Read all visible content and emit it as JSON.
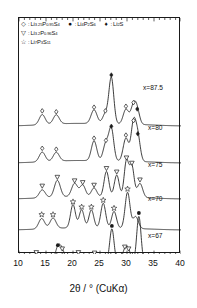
{
  "figure": {
    "kind": "xrd-pattern-stack",
    "axis_color": "#1a1a1a",
    "curve_color": "#1a1a1a",
    "background": "#ffffff"
  },
  "legend": {
    "rows": [
      [
        {
          "marker": "open-diamond",
          "glyph": "◇",
          "sep": ":",
          "label": "Li3.25P0.95S4",
          "label_html": "Li<sub>3.25</sub>P<sub>0.95</sub>S<sub>4</sub>"
        },
        {
          "marker": "filled-circle",
          "glyph": "●",
          "sep": ":",
          "label": "Li4P2S6",
          "label_html": "Li<sub>4</sub>P<sub>2</sub>S<sub>6</sub>"
        },
        {
          "marker": "filled-diamond",
          "glyph": "♦",
          "sep": ":",
          "label": "Li2S",
          "label_html": "Li<sub>2</sub>S"
        }
      ],
      [
        {
          "marker": "open-triangle-down",
          "glyph": "▽",
          "sep": ":",
          "label": "Li3.2P0.96S4",
          "label_html": "Li<sub>3.2</sub>P<sub>0.96</sub>S<sub>4</sub>"
        }
      ],
      [
        {
          "marker": "open-star",
          "glyph": "☆",
          "sep": ":",
          "label": "Li7P3S11",
          "label_html": "Li<sub>7</sub>P<sub>3</sub>S<sub>11</sub>"
        }
      ]
    ]
  },
  "xaxis": {
    "title": "2θ / ° (CuKα)",
    "min": 10,
    "max": 40,
    "major_ticks": [
      10,
      15,
      20,
      25,
      30,
      35,
      40
    ],
    "tick_labels": [
      "10",
      "15",
      "20",
      "25",
      "30",
      "35",
      "40"
    ],
    "minor_tick_step": 1
  },
  "yaxis": {
    "title": "",
    "tick_labels": [],
    "note": "Intensity / arb. units (offset stacked, unlabeled)"
  },
  "curve_labels": [
    {
      "text": "x=87.5",
      "composition_x": 87.5
    },
    {
      "text": "x=80",
      "composition_x": 80
    },
    {
      "text": "x=75",
      "composition_x": 75
    },
    {
      "text": "x=70",
      "composition_x": 70
    },
    {
      "text": "x=67",
      "composition_x": 67
    }
  ],
  "chart_data": {
    "type": "line",
    "title": "",
    "xlabel": "2θ / ° (CuKα)",
    "ylabel": "Intensity / arb. units",
    "xlim": [
      10,
      40
    ],
    "grid": false,
    "legend_position": "top-inside",
    "series": [
      {
        "name": "x=87.5",
        "label": "x=87.5",
        "peaks": [
          {
            "two_theta": 14.3,
            "height": 0.22,
            "width": 0.55,
            "marker": "open-diamond"
          },
          {
            "two_theta": 16.9,
            "height": 0.2,
            "width": 0.55,
            "marker": "open-diamond"
          },
          {
            "two_theta": 23.9,
            "height": 0.3,
            "width": 0.55,
            "marker": "open-diamond"
          },
          {
            "two_theta": 26.0,
            "height": 0.22,
            "width": 0.5,
            "marker": "open-diamond"
          },
          {
            "two_theta": 27.1,
            "height": 1.0,
            "width": 0.45,
            "marker": "filled-diamond"
          },
          {
            "two_theta": 29.8,
            "height": 0.32,
            "width": 0.5,
            "marker": "open-diamond"
          },
          {
            "two_theta": 31.2,
            "height": 0.4,
            "width": 0.5,
            "marker": "open-diamond"
          },
          {
            "two_theta": 31.9,
            "height": 0.26,
            "width": 0.45,
            "marker": "filled-diamond"
          }
        ]
      },
      {
        "name": "x=80",
        "label": "x=80",
        "peaks": [
          {
            "two_theta": 14.3,
            "height": 0.22,
            "width": 0.55,
            "marker": "open-diamond"
          },
          {
            "two_theta": 16.9,
            "height": 0.2,
            "width": 0.55,
            "marker": "open-diamond"
          },
          {
            "two_theta": 23.9,
            "height": 0.45,
            "width": 0.5,
            "marker": "open-diamond"
          },
          {
            "two_theta": 26.1,
            "height": 0.4,
            "width": 0.5,
            "marker": "open-diamond"
          },
          {
            "two_theta": 27.1,
            "height": 0.72,
            "width": 0.45,
            "marker": "filled-diamond"
          },
          {
            "two_theta": 29.8,
            "height": 0.52,
            "width": 0.5,
            "marker": "open-diamond"
          },
          {
            "two_theta": 31.2,
            "height": 0.85,
            "width": 0.45,
            "marker": "open-diamond"
          },
          {
            "two_theta": 32.0,
            "height": 0.55,
            "width": 0.45,
            "marker": "filled-diamond"
          }
        ]
      },
      {
        "name": "x=75",
        "label": "x=75",
        "peaks": [
          {
            "two_theta": 14.3,
            "height": 0.18,
            "width": 0.55,
            "marker": "open-triangle-down"
          },
          {
            "two_theta": 17.1,
            "height": 0.38,
            "width": 0.55,
            "marker": "open-triangle-down"
          },
          {
            "two_theta": 20.3,
            "height": 0.3,
            "width": 0.55,
            "marker": "open-triangle-down"
          },
          {
            "two_theta": 21.8,
            "height": 0.26,
            "width": 0.5,
            "marker": "open-triangle-down"
          },
          {
            "two_theta": 23.9,
            "height": 0.2,
            "width": 0.5,
            "marker": "open-triangle-down"
          },
          {
            "two_theta": 26.2,
            "height": 0.58,
            "width": 0.45,
            "marker": "open-triangle-down"
          },
          {
            "two_theta": 28.1,
            "height": 0.5,
            "width": 0.45,
            "marker": "open-triangle-down"
          },
          {
            "two_theta": 29.9,
            "height": 0.82,
            "width": 0.42,
            "marker": "open-triangle-down"
          },
          {
            "two_theta": 30.9,
            "height": 0.7,
            "width": 0.42,
            "marker": "open-triangle-down"
          },
          {
            "two_theta": 32.4,
            "height": 0.32,
            "width": 0.5,
            "marker": "open-triangle-down"
          }
        ]
      },
      {
        "name": "x=70",
        "label": "x=70",
        "peaks": [
          {
            "two_theta": 14.2,
            "height": 0.26,
            "width": 0.55,
            "marker": "open-star"
          },
          {
            "two_theta": 16.3,
            "height": 0.26,
            "width": 0.55,
            "marker": "open-star"
          },
          {
            "two_theta": 20.0,
            "height": 0.58,
            "width": 0.45,
            "marker": "open-star"
          },
          {
            "two_theta": 21.6,
            "height": 0.45,
            "width": 0.45,
            "marker": "open-star"
          },
          {
            "two_theta": 23.4,
            "height": 0.45,
            "width": 0.45,
            "marker": "open-star"
          },
          {
            "two_theta": 25.6,
            "height": 0.62,
            "width": 0.45,
            "marker": "open-star"
          },
          {
            "two_theta": 27.6,
            "height": 0.42,
            "width": 0.45,
            "marker": "open-star"
          },
          {
            "two_theta": 30.1,
            "height": 0.9,
            "width": 0.45,
            "marker": "open-star"
          },
          {
            "two_theta": 31.6,
            "height": 0.3,
            "width": 0.5,
            "marker": "none"
          }
        ]
      },
      {
        "name": "x=67",
        "label": "x=67",
        "peaks": [
          {
            "two_theta": 13.2,
            "height": 0.14,
            "width": 0.55,
            "marker": "open-triangle-down"
          },
          {
            "two_theta": 17.2,
            "height": 0.3,
            "width": 0.5,
            "marker": "filled-circle"
          },
          {
            "two_theta": 18.0,
            "height": 0.22,
            "width": 0.5,
            "marker": "open-triangle-down"
          },
          {
            "two_theta": 21.0,
            "height": 0.14,
            "width": 0.55,
            "marker": "open-triangle-down"
          },
          {
            "two_theta": 24.0,
            "height": 0.13,
            "width": 0.55,
            "marker": "open-triangle-down"
          },
          {
            "two_theta": 27.2,
            "height": 0.72,
            "width": 0.4,
            "marker": "filled-circle"
          },
          {
            "two_theta": 29.6,
            "height": 0.26,
            "width": 0.45,
            "marker": "open-triangle-down"
          },
          {
            "two_theta": 30.3,
            "height": 0.22,
            "width": 0.42,
            "marker": "open-triangle-down"
          },
          {
            "two_theta": 32.2,
            "height": 1.0,
            "width": 0.4,
            "marker": "filled-circle"
          }
        ]
      }
    ]
  }
}
